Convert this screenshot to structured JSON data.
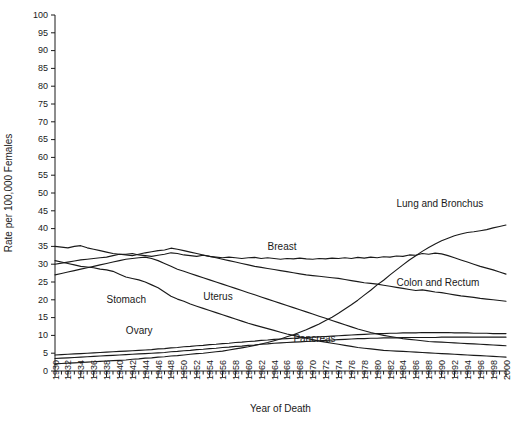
{
  "chart_data": {
    "type": "line",
    "title": "",
    "xlabel": "Year of Death",
    "ylabel": "Rate per 100,000 Females",
    "xlim": [
      1930,
      2000
    ],
    "ylim": [
      0,
      100
    ],
    "grid": false,
    "legend": "inline-labels",
    "ytick_labels": [
      "0",
      "5",
      "10",
      "15",
      "20",
      "25",
      "30",
      "35",
      "40",
      "45",
      "50",
      "55",
      "60",
      "65",
      "70",
      "75",
      "80",
      "85",
      "90",
      "95",
      "100"
    ],
    "ytick_values": [
      0,
      5,
      10,
      15,
      20,
      25,
      30,
      35,
      40,
      45,
      50,
      55,
      60,
      65,
      70,
      75,
      80,
      85,
      90,
      95,
      100
    ],
    "ytick_step": 5,
    "xtick_minor_step": 1,
    "xtick_label_step": 2,
    "xtick_labels": [
      "1930",
      "1932",
      "1934",
      "1936",
      "1938",
      "1940",
      "1942",
      "1944",
      "1946",
      "1948",
      "1950",
      "1952",
      "1954",
      "1956",
      "1958",
      "1960",
      "1962",
      "1964",
      "1966",
      "1968",
      "1970",
      "1972",
      "1974",
      "1976",
      "1978",
      "1980",
      "1982",
      "1984",
      "1986",
      "1988",
      "1990",
      "1992",
      "1994",
      "1996",
      "1998",
      "2000"
    ],
    "x": [
      1930,
      1931,
      1932,
      1933,
      1934,
      1935,
      1936,
      1937,
      1938,
      1939,
      1940,
      1941,
      1942,
      1943,
      1944,
      1945,
      1946,
      1947,
      1948,
      1949,
      1950,
      1951,
      1952,
      1953,
      1954,
      1955,
      1956,
      1957,
      1958,
      1959,
      1960,
      1961,
      1962,
      1963,
      1964,
      1965,
      1966,
      1967,
      1968,
      1969,
      1970,
      1971,
      1972,
      1973,
      1974,
      1975,
      1976,
      1977,
      1978,
      1979,
      1980,
      1981,
      1982,
      1983,
      1984,
      1985,
      1986,
      1987,
      1988,
      1989,
      1990,
      1991,
      1992,
      1993,
      1994,
      1995,
      1996,
      1997,
      1998,
      1999,
      2000
    ],
    "series": [
      {
        "name": "Lung and Bronchus",
        "label": "Lung and Bronchus",
        "label_x": 1983,
        "label_y": 46,
        "values": [
          2.0,
          2.1,
          2.2,
          2.3,
          2.4,
          2.5,
          2.6,
          2.7,
          2.8,
          2.9,
          3.0,
          3.1,
          3.3,
          3.4,
          3.6,
          3.7,
          3.9,
          4.0,
          4.2,
          4.3,
          4.5,
          4.7,
          4.9,
          5.0,
          5.2,
          5.4,
          5.6,
          5.9,
          6.2,
          6.5,
          6.8,
          7.2,
          7.6,
          8.0,
          8.5,
          9.0,
          9.6,
          10.2,
          10.9,
          11.6,
          12.4,
          13.2,
          14.2,
          15.1,
          16.2,
          17.4,
          18.6,
          19.9,
          21.3,
          22.7,
          24.2,
          25.5,
          27.0,
          28.4,
          29.8,
          31.2,
          32.4,
          33.6,
          34.7,
          35.7,
          36.6,
          37.3,
          38.0,
          38.5,
          38.9,
          39.1,
          39.4,
          39.7,
          40.2,
          40.6,
          41.0
        ]
      },
      {
        "name": "Breast",
        "label": "Breast",
        "label_x": 1963,
        "label_y": 34,
        "values": [
          35.0,
          34.8,
          34.6,
          35.0,
          35.2,
          34.6,
          34.2,
          33.8,
          33.4,
          33.0,
          32.8,
          32.8,
          33.0,
          32.6,
          32.4,
          32.2,
          32.5,
          32.8,
          33.2,
          33.0,
          32.6,
          32.4,
          32.2,
          32.5,
          32.2,
          32.0,
          31.8,
          32.0,
          31.8,
          31.6,
          31.8,
          31.9,
          31.6,
          31.8,
          31.6,
          31.4,
          31.6,
          31.5,
          31.7,
          31.5,
          31.4,
          31.6,
          31.5,
          31.7,
          31.6,
          31.8,
          31.6,
          31.9,
          31.7,
          32.0,
          31.8,
          32.1,
          32.0,
          32.3,
          32.2,
          32.6,
          32.5,
          33.0,
          32.8,
          33.1,
          32.9,
          32.4,
          31.8,
          31.2,
          30.6,
          30.0,
          29.4,
          28.9,
          28.4,
          27.8,
          27.2
        ]
      },
      {
        "name": "Colon and Rectum",
        "label": "Colon and Rectum",
        "label_x": 1983,
        "label_y": 24,
        "values": [
          30.0,
          30.3,
          30.6,
          30.9,
          31.2,
          31.4,
          31.6,
          31.8,
          32.0,
          32.4,
          32.8,
          32.6,
          32.4,
          32.8,
          33.2,
          33.5,
          33.8,
          34.0,
          34.5,
          34.2,
          33.8,
          33.4,
          33.0,
          32.6,
          32.2,
          31.8,
          31.4,
          31.0,
          30.6,
          30.2,
          29.8,
          29.4,
          29.1,
          28.8,
          28.5,
          28.2,
          27.9,
          27.6,
          27.3,
          27.0,
          26.8,
          26.6,
          26.4,
          26.2,
          26.0,
          25.7,
          25.4,
          25.1,
          24.8,
          24.6,
          24.4,
          24.1,
          23.8,
          23.5,
          23.2,
          22.9,
          22.6,
          22.8,
          22.5,
          22.2,
          22.0,
          21.7,
          21.4,
          21.1,
          20.9,
          20.7,
          20.4,
          20.2,
          20.0,
          19.8,
          19.6
        ]
      },
      {
        "name": "Stomach",
        "label": "Stomach",
        "label_x": 1938,
        "label_y": 19,
        "values": [
          31.0,
          30.6,
          30.2,
          29.8,
          29.4,
          29.2,
          29.0,
          28.6,
          28.4,
          28.0,
          27.2,
          26.4,
          26.0,
          25.6,
          25.0,
          24.2,
          23.4,
          22.2,
          21.0,
          20.2,
          19.6,
          18.8,
          18.2,
          17.6,
          17.0,
          16.4,
          15.8,
          15.2,
          14.6,
          14.0,
          13.4,
          12.9,
          12.4,
          11.9,
          11.4,
          10.9,
          10.4,
          10.0,
          9.6,
          9.2,
          8.8,
          8.4,
          8.1,
          7.8,
          7.5,
          7.2,
          6.9,
          6.6,
          6.4,
          6.2,
          6.0,
          5.8,
          5.7,
          5.6,
          5.5,
          5.4,
          5.3,
          5.2,
          5.1,
          5.0,
          4.9,
          4.8,
          4.7,
          4.6,
          4.5,
          4.4,
          4.3,
          4.2,
          4.1,
          4.0,
          3.9
        ]
      },
      {
        "name": "Uterus",
        "label": "Uterus",
        "label_x": 1953,
        "label_y": 20,
        "values": [
          27.0,
          27.4,
          27.8,
          28.2,
          28.6,
          29.0,
          29.4,
          29.8,
          30.2,
          30.6,
          31.0,
          31.4,
          31.6,
          31.8,
          32.0,
          31.6,
          31.0,
          30.2,
          29.4,
          28.6,
          28.0,
          27.4,
          26.8,
          26.2,
          25.6,
          25.0,
          24.4,
          23.8,
          23.2,
          22.6,
          22.0,
          21.4,
          20.8,
          20.2,
          19.6,
          19.0,
          18.4,
          17.8,
          17.2,
          16.6,
          16.0,
          15.4,
          14.8,
          14.2,
          13.6,
          13.0,
          12.4,
          11.8,
          11.3,
          10.8,
          10.4,
          10.0,
          9.7,
          9.4,
          9.1,
          8.9,
          8.7,
          8.5,
          8.3,
          8.2,
          8.1,
          8.0,
          7.9,
          7.8,
          7.7,
          7.6,
          7.5,
          7.4,
          7.3,
          7.2,
          7.1
        ]
      },
      {
        "name": "Ovary",
        "label": "Ovary",
        "label_x": 1941,
        "label_y": 10.5,
        "values": [
          4.5,
          4.6,
          4.7,
          4.8,
          4.9,
          5.0,
          5.1,
          5.2,
          5.3,
          5.4,
          5.5,
          5.6,
          5.7,
          5.8,
          5.9,
          6.0,
          6.2,
          6.3,
          6.5,
          6.6,
          6.8,
          6.9,
          7.1,
          7.2,
          7.4,
          7.5,
          7.7,
          7.8,
          8.0,
          8.1,
          8.3,
          8.4,
          8.6,
          8.7,
          8.9,
          9.0,
          9.1,
          9.2,
          9.3,
          9.4,
          9.5,
          9.6,
          9.7,
          9.8,
          9.9,
          10.0,
          10.1,
          10.2,
          10.3,
          10.4,
          10.5,
          10.5,
          10.6,
          10.6,
          10.7,
          10.7,
          10.7,
          10.8,
          10.8,
          10.8,
          10.8,
          10.8,
          10.7,
          10.7,
          10.7,
          10.6,
          10.6,
          10.6,
          10.5,
          10.5,
          10.5
        ]
      },
      {
        "name": "Pancreas",
        "label": "Pancreas",
        "label_x": 1967,
        "label_y": 8.2,
        "values": [
          3.5,
          3.6,
          3.7,
          3.8,
          3.9,
          4.0,
          4.1,
          4.2,
          4.3,
          4.4,
          4.5,
          4.6,
          4.7,
          4.8,
          4.9,
          5.0,
          5.1,
          5.2,
          5.4,
          5.5,
          5.7,
          5.8,
          6.0,
          6.1,
          6.3,
          6.4,
          6.6,
          6.7,
          6.9,
          7.0,
          7.2,
          7.3,
          7.5,
          7.6,
          7.8,
          7.9,
          8.0,
          8.1,
          8.2,
          8.3,
          8.4,
          8.5,
          8.6,
          8.7,
          8.8,
          8.9,
          9.0,
          9.1,
          9.1,
          9.2,
          9.2,
          9.3,
          9.3,
          9.3,
          9.4,
          9.4,
          9.4,
          9.4,
          9.4,
          9.4,
          9.5,
          9.5,
          9.5,
          9.5,
          9.5,
          9.5,
          9.5,
          9.5,
          9.5,
          9.5,
          9.5
        ]
      }
    ]
  }
}
